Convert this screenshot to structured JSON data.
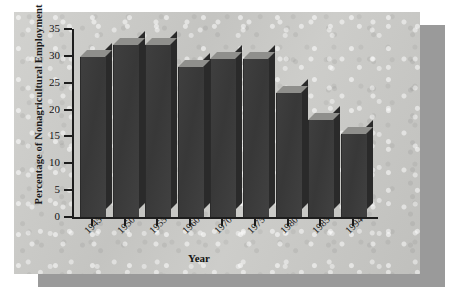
{
  "figure": {
    "panel_color": "#c9c9c6",
    "shadow_color": "#9a9a9a",
    "bar_color": "#3a3a3a",
    "bar_top_color": "#8f8f8c",
    "bar_side_color": "#2a2a2a",
    "axis_color": "#1d1d1d"
  },
  "chart_data": {
    "type": "bar",
    "title": "",
    "xlabel": "Year",
    "ylabel": "Percentage of Nonagricultural Employment",
    "categories": [
      "1945",
      "1950",
      "1955",
      "1960",
      "1970",
      "1975",
      "1980",
      "1985",
      "1994"
    ],
    "values": [
      29.8,
      32.0,
      32.0,
      28.0,
      29.5,
      29.5,
      23.0,
      18.0,
      15.5
    ],
    "ylim": [
      0,
      35
    ],
    "yticks": [
      0,
      5,
      10,
      15,
      20,
      25,
      30,
      35
    ],
    "ytick_labels": [
      "0",
      "5",
      "10",
      "15",
      "20",
      "25",
      "30",
      "35"
    ],
    "grid": false,
    "legend": false,
    "three_d": true
  }
}
